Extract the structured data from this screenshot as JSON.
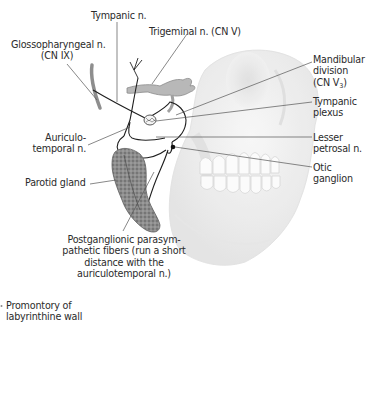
{
  "figure": {
    "labels": {
      "tympanic_n": "Tympanic n.",
      "trigeminal_n": "Trigeminal n. (CN V)",
      "glossopharyngeal_n_line1": "Glossopharyngeal n.",
      "glossopharyngeal_n_line2": "(CN IX)",
      "mandibular_line1": "Mandibular",
      "mandibular_line2": "division",
      "mandibular_line3_prefix": "(CN V",
      "mandibular_line3_sub": "3",
      "mandibular_line3_suffix": ")",
      "tympanic_plexus_line1": "Tympanic",
      "tympanic_plexus_line2": "plexus",
      "auriculotemporal_line1": "Auriculo-",
      "auriculotemporal_line2": "temporal n.",
      "lesser_petrosal_line1": "Lesser",
      "lesser_petrosal_line2": "petrosal n.",
      "otic_ganglion_line1": "Otic",
      "otic_ganglion_line2": "ganglion",
      "parotid_gland": "Parotid gland",
      "postganglionic_line1": "Postganglionic parasym-",
      "postganglionic_line2": "pathetic fibers (run a short",
      "postganglionic_line3": "distance with the",
      "postganglionic_line4": "auriculotemporal n.)",
      "promontory_line1": "Promontory of",
      "promontory_line2": "labyrinthine wall"
    },
    "colors": {
      "background": "#ffffff",
      "text": "#2b2b2b",
      "leader_line": "#555555",
      "nerve": "#222222",
      "skull": "#e6e6e6",
      "gland": "#8a8a8a"
    }
  }
}
